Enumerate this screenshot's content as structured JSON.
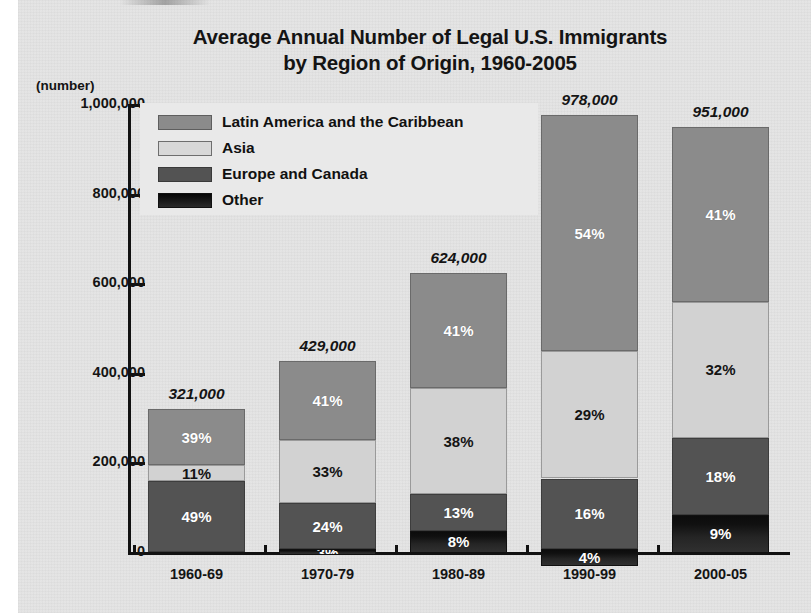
{
  "chart_data": {
    "type": "bar",
    "subtype": "stacked-percentage",
    "title": "Average Annual Number of Legal U.S. Immigrants by Region of Origin, 1960-2005",
    "title_line1": "Average Annual Number of Legal U.S. Immigrants",
    "title_line2": "by Region of Origin, 1960-2005",
    "unit_label": "(number)",
    "xlabel": "",
    "ylabel": "",
    "ylim": [
      0,
      1000000
    ],
    "grid": false,
    "legend_position": "inside-top-left",
    "categories": [
      "1960-69",
      "1970-79",
      "1980-89",
      "1990-99",
      "2000-05"
    ],
    "totals": [
      321000,
      429000,
      624000,
      978000,
      951000
    ],
    "total_labels": [
      "321,000",
      "429,000",
      "624,000",
      "978,000",
      "951,000"
    ],
    "ytick_values": [
      0,
      200000,
      400000,
      600000,
      800000,
      1000000
    ],
    "ytick_labels": [
      "0",
      "200,000",
      "400,000",
      "600,000",
      "800,000",
      "1,000,000"
    ],
    "series": [
      {
        "name": "Latin America and the Caribbean",
        "color": "#8b8b8b",
        "values": [
          39,
          41,
          41,
          54,
          41
        ],
        "labels": [
          "39%",
          "41%",
          "41%",
          "54%",
          "41%"
        ]
      },
      {
        "name": "Asia",
        "color": "#d2d2d2",
        "values": [
          11,
          33,
          38,
          29,
          32
        ],
        "labels": [
          "11%",
          "33%",
          "38%",
          "29%",
          "32%"
        ]
      },
      {
        "name": "Europe and Canada",
        "color": "#535353",
        "values": [
          49,
          24,
          13,
          16,
          18
        ],
        "labels": [
          "49%",
          "24%",
          "13%",
          "16%",
          "18%"
        ]
      },
      {
        "name": "Other",
        "color": "#141414",
        "values": [
          1,
          3,
          8,
          4,
          9
        ],
        "labels": [
          "1%",
          "3%",
          "8%",
          "4%",
          "9%"
        ]
      }
    ]
  },
  "legend": {
    "items": [
      {
        "label": "Latin America and the Caribbean",
        "swatch": "latin"
      },
      {
        "label": "Asia",
        "swatch": "asia"
      },
      {
        "label": "Europe and Canada",
        "swatch": "europe"
      },
      {
        "label": "Other",
        "swatch": "other"
      }
    ]
  }
}
